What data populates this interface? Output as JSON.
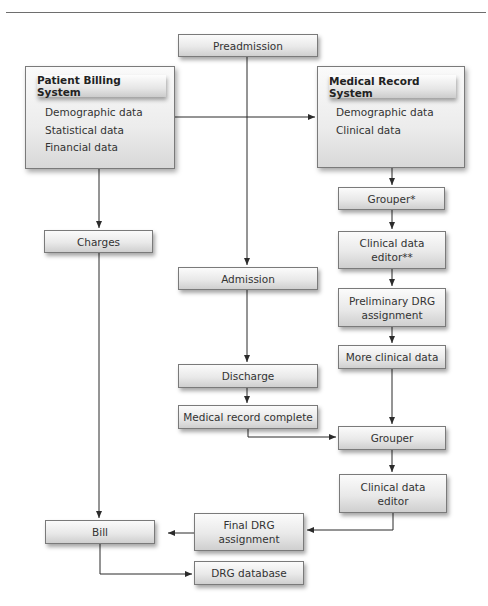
{
  "diagram": {
    "nodes": {
      "preadmission": "Preadmission",
      "patient_billing_system": {
        "title": "Patient Billing System",
        "items": [
          "Demographic data",
          "Statistical data",
          "Financial data"
        ]
      },
      "medical_record_system": {
        "title": "Medical Record System",
        "items": [
          "Demographic data",
          "Clinical data"
        ]
      },
      "grouper_star": "Grouper*",
      "charges": "Charges",
      "clinical_data_editor_2star": [
        "Clinical data",
        "editor**"
      ],
      "admission": "Admission",
      "preliminary_drg": [
        "Preliminary DRG",
        "assignment"
      ],
      "more_clinical_data": "More clinical data",
      "discharge": "Discharge",
      "medical_record_complete": "Medical record complete",
      "grouper": "Grouper",
      "clinical_data_editor": [
        "Clinical data",
        "editor"
      ],
      "final_drg": [
        "Final DRG",
        "assignment"
      ],
      "bill": "Bill",
      "drg_database": "DRG database"
    },
    "edges": [
      {
        "from": "Patient Billing System",
        "to": "Medical Record System"
      },
      {
        "from": "Patient Billing System",
        "to": "Charges"
      },
      {
        "from": "Preadmission",
        "to": "Admission"
      },
      {
        "from": "Medical Record System",
        "to": "Grouper*"
      },
      {
        "from": "Grouper*",
        "to": "Clinical data editor**"
      },
      {
        "from": "Clinical data editor**",
        "to": "Preliminary DRG assignment"
      },
      {
        "from": "Preliminary DRG assignment",
        "to": "More clinical data"
      },
      {
        "from": "More clinical data",
        "to": "Grouper"
      },
      {
        "from": "Admission",
        "to": "Discharge"
      },
      {
        "from": "Discharge",
        "to": "Medical record complete"
      },
      {
        "from": "Medical record complete",
        "to": "Grouper"
      },
      {
        "from": "Grouper",
        "to": "Clinical data editor"
      },
      {
        "from": "Clinical data editor",
        "to": "Final DRG assignment"
      },
      {
        "from": "Final DRG assignment",
        "to": "Bill"
      },
      {
        "from": "Charges",
        "to": "Bill"
      },
      {
        "from": "Bill",
        "to": "DRG database"
      }
    ],
    "colors": {
      "line": "#2b2b2b",
      "box_border": "#7a7a7a",
      "box_fill_top": "#fbfbfb",
      "box_fill_bottom": "#cfcfcf"
    }
  }
}
